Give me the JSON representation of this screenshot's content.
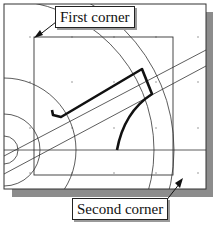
{
  "callouts": {
    "first": "First corner",
    "second": "Second corner"
  },
  "colors": {
    "frame": "#333333",
    "shadow": "#8c8c8c",
    "geometry": "#222222",
    "thick_profile": "#111111",
    "grid_dots": "#777777"
  },
  "diagram": {
    "type": "cad-window-selection"
  }
}
